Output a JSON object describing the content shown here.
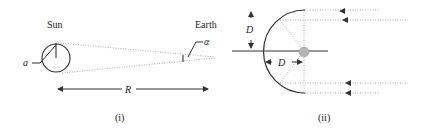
{
  "panel_i": {
    "caption": "(i)",
    "sun_label": "Sun",
    "earth_label": "Earth",
    "radius_label": "a",
    "angle_label": "α",
    "distance_label": "R"
  },
  "panel_ii": {
    "caption": "(ii)",
    "vertical_dim_label": "D",
    "horizontal_dim_label": "D"
  },
  "colors": {
    "line": "#333333",
    "dotted": "#9a9a9a",
    "focus_blob": "#b5b5b5"
  }
}
